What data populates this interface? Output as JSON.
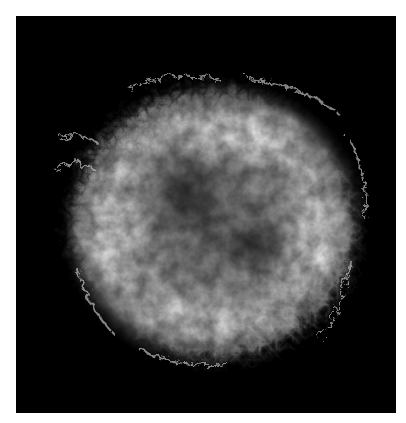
{
  "image": {
    "subject": "supernova remnant nebula",
    "description": "Grayscale astronomical image of a roughly spherical, filamentary supernova remnant shell on a black background, framed by a white border",
    "colors": {
      "background": "#ffffff",
      "frame": "#000000",
      "nebula_bright": "#e8e8e8",
      "nebula_mid": "#8a8a8a"
    }
  }
}
